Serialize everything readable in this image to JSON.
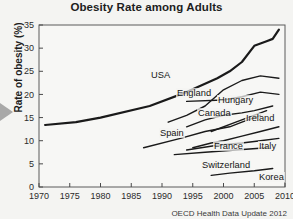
{
  "chart_data": {
    "type": "line",
    "title": "Obesity Rate among Adults",
    "xlabel": "",
    "ylabel": "Rate of obesity (%)",
    "source": "OECD Health Data Update 2012",
    "xlim": [
      1970,
      2010
    ],
    "ylim": [
      0,
      35
    ],
    "xticks": [
      "1970",
      "1975",
      "1980",
      "1985",
      "1990",
      "1995",
      "2000",
      "2005",
      "2010"
    ],
    "yticks": [
      "0",
      "5",
      "10",
      "15",
      "20",
      "25",
      "30",
      "35"
    ],
    "grid": false,
    "legend": "inline-labels",
    "line_color": "#1a1a1a",
    "background": "#f4f4f2",
    "series": [
      {
        "name": "USA",
        "label_x": 150,
        "label_y": 70,
        "x": [
          1971,
          1976,
          1980,
          1988,
          1994,
          1999,
          2001,
          2003,
          2005,
          2007,
          2008,
          2009
        ],
        "y": [
          13.4,
          14.0,
          15.0,
          17.5,
          20.5,
          23.5,
          25.0,
          27.0,
          30.5,
          31.5,
          32.0,
          34.0
        ]
      },
      {
        "name": "England",
        "label_x": 176,
        "label_y": 88,
        "x": [
          1991,
          1994,
          1997,
          2000,
          2003,
          2006,
          2009
        ],
        "y": [
          14.0,
          15.5,
          17.5,
          21.0,
          23.0,
          24.0,
          23.5
        ]
      },
      {
        "name": "Hungary",
        "label_x": 217,
        "label_y": 95,
        "x": [
          1994,
          2000,
          2003,
          2006,
          2009
        ],
        "y": [
          18.5,
          18.8,
          19.5,
          20.5,
          20.0
        ]
      },
      {
        "name": "Canada",
        "label_x": 197,
        "label_y": 108,
        "x": [
          1994,
          1997,
          2000,
          2003,
          2005,
          2008
        ],
        "y": [
          13.0,
          14.5,
          15.5,
          16.0,
          16.5,
          17.5
        ]
      },
      {
        "name": "Ireland",
        "label_x": 245,
        "label_y": 113,
        "x": [
          1998,
          2002,
          2007
        ],
        "y": [
          12.0,
          14.0,
          16.5
        ]
      },
      {
        "name": "Spain",
        "label_x": 159,
        "label_y": 128,
        "x": [
          1987,
          1993,
          1997,
          2001,
          2003,
          2006
        ],
        "y": [
          8.5,
          10.5,
          12.0,
          13.0,
          14.0,
          15.5
        ]
      },
      {
        "name": "France",
        "label_x": 213,
        "label_y": 141,
        "x": [
          1995,
          1998,
          2000,
          2003,
          2006,
          2009
        ],
        "y": [
          8.5,
          9.5,
          10.0,
          11.0,
          12.0,
          13.0
        ]
      },
      {
        "name": "Italy",
        "label_x": 258,
        "label_y": 141,
        "x": [
          1994,
          1999,
          2003,
          2006,
          2009
        ],
        "y": [
          8.0,
          9.0,
          9.5,
          10.0,
          10.5
        ]
      },
      {
        "name": "Switzerland",
        "label_x": 201,
        "label_y": 160,
        "x": [
          1992,
          1997,
          2002,
          2007
        ],
        "y": [
          7.0,
          7.5,
          8.0,
          8.5
        ]
      },
      {
        "name": "Korea",
        "label_x": 258,
        "label_y": 172,
        "x": [
          1998,
          2001,
          2005,
          2008
        ],
        "y": [
          2.5,
          3.0,
          3.5,
          4.0
        ]
      }
    ]
  }
}
